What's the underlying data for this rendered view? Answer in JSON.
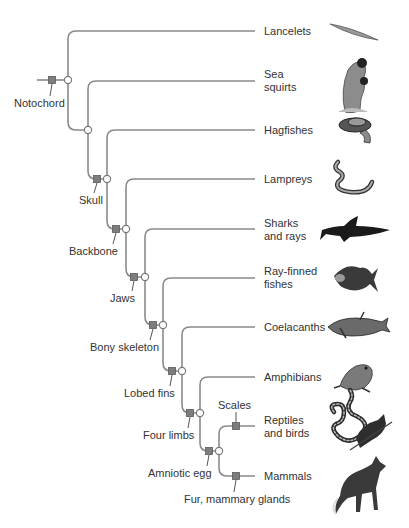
{
  "colors": {
    "branch": "#8a8a8a",
    "character_marker": "#7d7d7d",
    "node": "#ffffff",
    "text": "#333333"
  },
  "taxa": [
    {
      "label_line1": "Lancelets",
      "label_line2": "",
      "icon": "lancelet-icon"
    },
    {
      "label_line1": "Sea",
      "label_line2": "squirts",
      "icon": "sea-squirt-icon"
    },
    {
      "label_line1": "Hagfishes",
      "label_line2": "",
      "icon": "hagfish-icon"
    },
    {
      "label_line1": "Lampreys",
      "label_line2": "",
      "icon": "lamprey-icon"
    },
    {
      "label_line1": "Sharks",
      "label_line2": "and rays",
      "icon": "shark-icon"
    },
    {
      "label_line1": "Ray-finned",
      "label_line2": "fishes",
      "icon": "ray-finned-fish-icon"
    },
    {
      "label_line1": "Coelacanths",
      "label_line2": "",
      "icon": "coelacanth-icon"
    },
    {
      "label_line1": "Amphibians",
      "label_line2": "",
      "icon": "frog-icon"
    },
    {
      "label_line1": "Reptiles",
      "label_line2": "and birds",
      "icon": "snake-and-bird-icon"
    },
    {
      "label_line1": "Mammals",
      "label_line2": "",
      "icon": "fox-icon"
    }
  ],
  "characters": [
    {
      "label": "Notochord"
    },
    {
      "label": "Skull"
    },
    {
      "label": "Backbone"
    },
    {
      "label": "Jaws"
    },
    {
      "label": "Bony skeleton"
    },
    {
      "label": "Lobed fins"
    },
    {
      "label": "Four limbs"
    },
    {
      "label": "Amniotic egg"
    },
    {
      "label": "Scales"
    },
    {
      "label": "Fur, mammary glands"
    }
  ]
}
